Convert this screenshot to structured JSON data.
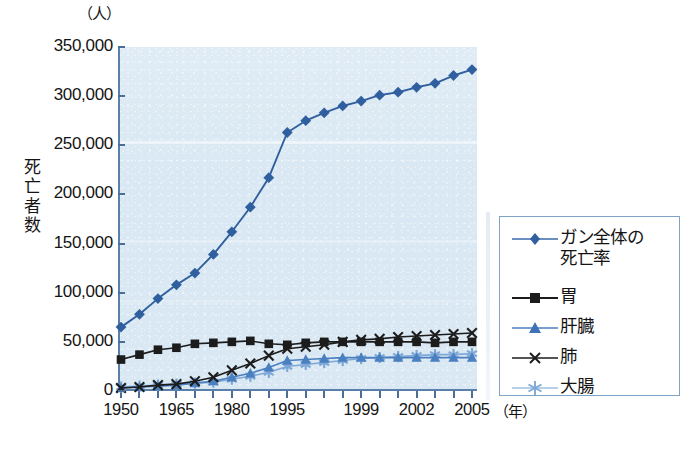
{
  "chart_data": {
    "type": "line",
    "title": "",
    "unit_label": "（人）",
    "ylabel": "死亡者数",
    "xlabel": "（年）",
    "ylim": [
      0,
      350000
    ],
    "y_ticks": [
      "0",
      "50,000",
      "100,000",
      "150,000",
      "200,000",
      "250,000",
      "300,000",
      "350,000"
    ],
    "y_tick_values": [
      0,
      50000,
      100000,
      150000,
      200000,
      250000,
      300000,
      350000
    ],
    "x_tick_labels": [
      "1950",
      "1965",
      "1980",
      "1995",
      "1999",
      "2002",
      "2005"
    ],
    "x_tick_years": [
      1950,
      1965,
      1980,
      1995,
      1999,
      2002,
      2005
    ],
    "grid": false,
    "legend_position": "right",
    "x": [
      1950,
      1955,
      1960,
      1965,
      1970,
      1975,
      1980,
      1985,
      1990,
      1995,
      1996,
      1997,
      1998,
      1999,
      2000,
      2001,
      2002,
      2003,
      2004,
      2005
    ],
    "series": [
      {
        "name": "ガン全体の死亡率",
        "legend_label": "ガン全体の\n死亡率",
        "marker": "diamond",
        "color": "#2f5f9e",
        "values": [
          65000,
          78000,
          94000,
          108000,
          120000,
          139000,
          162000,
          187000,
          217000,
          263000,
          275000,
          283000,
          290000,
          295000,
          301000,
          304000,
          309000,
          313000,
          321000,
          327000
        ]
      },
      {
        "name": "胃",
        "legend_label": "胃",
        "marker": "square",
        "color": "#1c1c1c",
        "values": [
          32000,
          37000,
          42000,
          44000,
          48000,
          49000,
          50000,
          51000,
          48000,
          47000,
          49000,
          50000,
          50000,
          50000,
          50000,
          50000,
          50000,
          49000,
          50000,
          50000
        ]
      },
      {
        "name": "肝臓",
        "legend_label": "肝臓",
        "marker": "triangle",
        "color": "#4a7fc0",
        "values": [
          3000,
          4000,
          5000,
          6000,
          8000,
          10000,
          14000,
          18000,
          24000,
          31000,
          32000,
          33000,
          34000,
          34000,
          34000,
          34000,
          34000,
          34000,
          34000,
          34000
        ]
      },
      {
        "name": "肺",
        "legend_label": "肺",
        "marker": "x",
        "color": "#1c1c1c",
        "values": [
          3000,
          4000,
          6000,
          7000,
          10000,
          14000,
          21000,
          28000,
          36000,
          43000,
          45000,
          47000,
          50000,
          52000,
          53000,
          55000,
          56000,
          57000,
          58000,
          59000
        ]
      },
      {
        "name": "大腸",
        "legend_label": "大腸",
        "marker": "star",
        "color": "#7fa8d6",
        "values": [
          4000,
          5000,
          6000,
          7000,
          8000,
          9000,
          12000,
          15000,
          19000,
          25000,
          27000,
          29000,
          31000,
          33000,
          34000,
          35000,
          36000,
          37000,
          37000,
          38000
        ]
      }
    ]
  },
  "legend": {
    "items": [
      {
        "label": "ガン全体の\n死亡率",
        "marker": "diamond-icon",
        "color": "#2f5f9e"
      },
      {
        "label": "胃",
        "marker": "square-icon",
        "color": "#1c1c1c"
      },
      {
        "label": "肝臓",
        "marker": "triangle-icon",
        "color": "#4a7fc0"
      },
      {
        "label": "肺",
        "marker": "x-icon",
        "color": "#1c1c1c"
      },
      {
        "label": "大腸",
        "marker": "star-icon",
        "color": "#7fa8d6"
      }
    ]
  },
  "axes": {
    "unit_top": "（人）",
    "y_title_chars": [
      "死",
      "亡",
      "者",
      "数"
    ],
    "x_unit": "（年）"
  },
  "colors": {
    "plot_background": "#d9e8f3",
    "axis_line": "#5a7fa8",
    "legend_border": "#7fa3c6",
    "series_total": "#2f5f9e",
    "series_stomach": "#1c1c1c",
    "series_liver": "#4a7fc0",
    "series_lung": "#1c1c1c",
    "series_colon": "#7fa8d6",
    "page_background": "#ffffff"
  }
}
